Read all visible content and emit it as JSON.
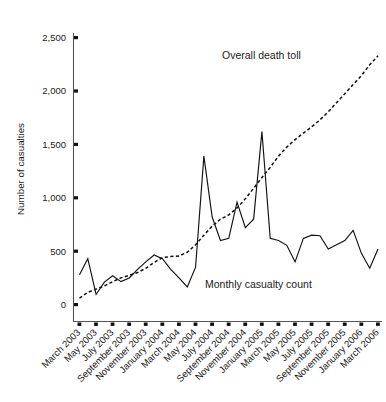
{
  "chart_data": {
    "type": "line",
    "title": "",
    "xlabel": "",
    "ylabel": "Number of casualties",
    "ylim": [
      0,
      2500
    ],
    "yticks": [
      0,
      500,
      1000,
      1500,
      2000,
      2500
    ],
    "ytick_labels": [
      "0",
      "500",
      "1,000",
      "1,500",
      "2,000",
      "2,500"
    ],
    "grid": false,
    "legend": "inline-annotations",
    "x": [
      "March 2003",
      "April 2003",
      "May 2003",
      "June 2003",
      "July 2003",
      "August 2003",
      "September 2003",
      "October 2003",
      "November 2003",
      "December 2003",
      "January 2004",
      "February 2004",
      "March 2004",
      "April 2004",
      "May 2004",
      "June 2004",
      "July 2004",
      "August 2004",
      "September 2004",
      "October 2004",
      "November 2004",
      "December 2004",
      "January 2005",
      "February 2005",
      "March 2005",
      "April 2005",
      "May 2005",
      "June 2005",
      "July 2005",
      "August 2005",
      "September 2005",
      "October 2005",
      "November 2005",
      "December 2005",
      "January 2006",
      "February 2006",
      "March 2006"
    ],
    "xtick_labels": [
      "March 2003",
      "May 2003",
      "July 2003",
      "September 2003",
      "November 2003",
      "January 2004",
      "March 2004",
      "May 2004",
      "July 2004",
      "September 2004",
      "November 2004",
      "January 2005",
      "March 2005",
      "May 2005",
      "July 2005",
      "September 2005",
      "November 2005",
      "January 2006",
      "March 2006"
    ],
    "series": [
      {
        "name": "Monthly casualty count",
        "style": "solid",
        "annotation": "Monthly casualty count",
        "values": [
          280,
          430,
          95,
          210,
          270,
          215,
          250,
          330,
          400,
          465,
          430,
          330,
          250,
          165,
          350,
          1390,
          820,
          600,
          620,
          960,
          720,
          800,
          1620,
          620,
          600,
          555,
          400,
          620,
          650,
          645,
          520,
          560,
          600,
          695,
          480,
          340,
          520
        ]
      },
      {
        "name": "Overall death toll",
        "style": "dashed",
        "annotation": "Overall death toll",
        "values": [
          60,
          115,
          145,
          175,
          215,
          250,
          275,
          300,
          340,
          395,
          440,
          450,
          455,
          490,
          560,
          650,
          735,
          800,
          840,
          905,
          990,
          1090,
          1190,
          1285,
          1390,
          1475,
          1545,
          1605,
          1665,
          1730,
          1805,
          1890,
          1975,
          2060,
          2145,
          2245,
          2330
        ]
      }
    ],
    "annotations": [
      {
        "text": "Overall death toll",
        "x": 222,
        "y": 59
      },
      {
        "text": "Monthly casualty count",
        "x": 205,
        "y": 288
      }
    ]
  },
  "colors": {
    "line": "#111111",
    "axis": "#555555",
    "text": "#1a1a1a",
    "background": "#ffffff"
  }
}
